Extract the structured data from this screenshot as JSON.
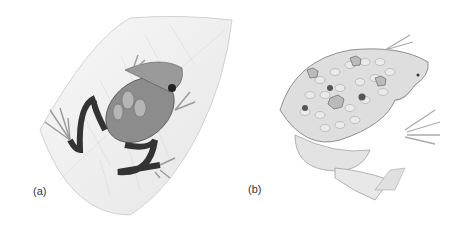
{
  "figure": {
    "panels": [
      {
        "label": "(a)",
        "subject": "tree frog carrying tadpoles/eggs on back, resting on a leaf"
      },
      {
        "label": "(b)",
        "subject": "Surinam toad (Pipa) with young emerging from pits in back skin"
      }
    ],
    "colors": {
      "ink": "#333333",
      "leaf": "#f2f2f2",
      "frog_a": "#8a8a8a",
      "frog_b": "#d9d9d9"
    }
  }
}
